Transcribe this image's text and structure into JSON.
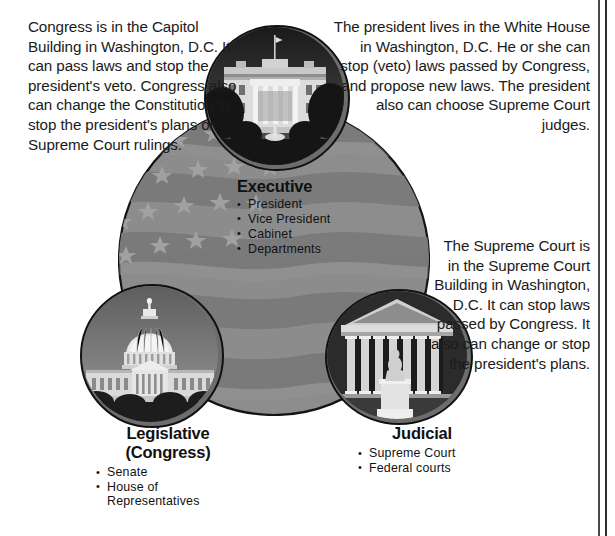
{
  "diagram": {
    "colors": {
      "flag_field": "#8a8a8a",
      "flag_stripe_dark": "#7c7c7c",
      "flag_star": "#9d9d9d",
      "outline": "#141414",
      "text": "#1b1b1b",
      "rule": "#3b3b3b"
    }
  },
  "paragraphs": {
    "legislative": "Congress is in the Capitol Building in Washington, D.C. It can pass laws and stop the president's veto. Congress also can change the Constitution to stop the president's plans or Supreme Court rulings.",
    "executive": "The president lives in the White House in Washington, D.C.  He or she can stop (veto) laws passed by Congress, and propose new laws. The president also can choose Supreme Court judges.",
    "judicial": "The Supreme Court is in the Supreme Court Building in Washington, D.C. It can stop laws passed by Congress.  It also can change or stop the president's plans."
  },
  "branches": {
    "executive": {
      "title": "Executive",
      "members": [
        "President",
        "Vice President",
        "Cabinet",
        "Departments"
      ]
    },
    "legislative": {
      "title": "Legislative",
      "subtitle": "(Congress)",
      "members": [
        "Senate",
        "House of\nRepresentatives"
      ]
    },
    "judicial": {
      "title": "Judicial",
      "members": [
        "Supreme Court",
        "Federal courts"
      ]
    }
  },
  "photos": {
    "whitehouse": "photo-white-house",
    "capitol": "photo-us-capitol",
    "supremecourt": "photo-supreme-court-building"
  }
}
